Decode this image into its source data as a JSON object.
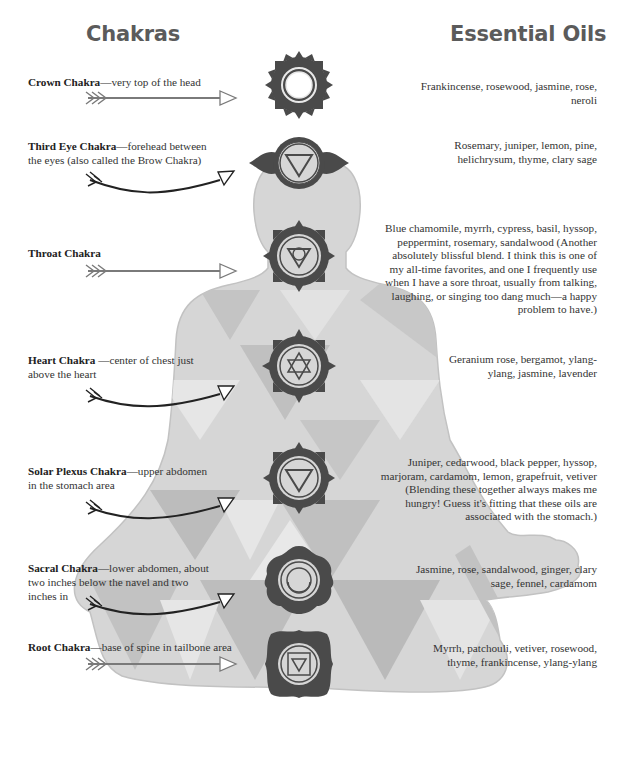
{
  "headings": {
    "left": "Chakras",
    "right": "Essential Oils"
  },
  "colors": {
    "body_fill": "#d6d6d6",
    "body_outline": "#c2c2c2",
    "triangle_dark": "#bdbdbd",
    "triangle_light": "#e4e4e4",
    "chakra_fill": "#4a4a4a",
    "arrow_light": "#7a7a7a",
    "arrow_dark": "#222222",
    "heading": "#5b5b5b"
  },
  "chakras": [
    {
      "name": "Crown Chakra",
      "description": "—very top of the head",
      "oils": "Frankincense, rosewood, jasmine, rose, neroli",
      "symbol": "circle",
      "arrow_style": "straight-light"
    },
    {
      "name": "Third Eye Chakra",
      "description": "—forehead between the eyes (also called the Brow Chakra)",
      "oils": "Rosemary, juniper, lemon, pine, helichrysum, thyme, clary sage",
      "symbol": "inverted-triangle-wings",
      "arrow_style": "curved-dark"
    },
    {
      "name": "Throat Chakra",
      "description": "",
      "oils": "Blue chamomile, myrrh, cypress, basil, hyssop, peppermint, rosemary, sandalwood (Another absolutely blissful blend. I think this is one of my all-time favorites, and one I frequently use when I have a sore throat, usually from talking, laughing, or singing too dang much—a happy problem to have.)",
      "symbol": "triangle-circle",
      "arrow_style": "straight-light"
    },
    {
      "name": "Heart Chakra",
      "description": " —center of chest just above the heart",
      "oils": "Geranium rose, bergamot, ylang-ylang, jasmine, lavender",
      "symbol": "six-point-star",
      "arrow_style": "curved-dark"
    },
    {
      "name": "Solar Plexus Chakra",
      "description": "—upper abdomen in the stomach area",
      "oils": "Juniper, cedarwood, black pepper, hyssop, marjoram, cardamom, lemon, grapefruit, vetiver (Blending these together always makes me hungry! Guess it's fitting that these oils are associated with the stomach.)",
      "symbol": "inverted-triangle",
      "arrow_style": "curved-dark"
    },
    {
      "name": "Sacral Chakra",
      "description": "—lower abdomen, about two inches below the navel and two inches in",
      "oils": "Jasmine, rose, sandalwood, ginger, clary sage, fennel, cardamom",
      "symbol": "crescent",
      "arrow_style": "curved-dark"
    },
    {
      "name": "Root Chakra",
      "description": "—base of spine in tailbone area",
      "oils": "Myrrh, patchouli, vetiver, rosewood, thyme, frankincense, ylang-ylang",
      "symbol": "square-triangle",
      "arrow_style": "straight-light"
    }
  ]
}
